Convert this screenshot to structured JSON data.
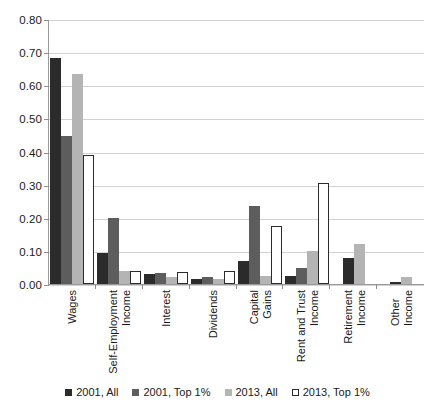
{
  "chart_data": {
    "type": "bar",
    "title": "",
    "subtitle": "",
    "xlabel": "",
    "ylabel": "",
    "ylim": [
      0.0,
      0.8
    ],
    "ytick_labels": [
      "0.80",
      "0.70",
      "0.60",
      "0.50",
      "0.40",
      "0.30",
      "0.20",
      "0.10",
      "0.00"
    ],
    "ytick_values": [
      0.8,
      0.7,
      0.6,
      0.5,
      0.4,
      0.3,
      0.2,
      0.1,
      0.0
    ],
    "grid": true,
    "legend_position": "bottom",
    "categories": [
      "Wages",
      "Self-Employment Income",
      "Interest",
      "Dividends",
      "Capital Gains",
      "Rent and Trust Income",
      "Retirement Income",
      "Other Income"
    ],
    "category_lines": [
      [
        "Wages",
        ""
      ],
      [
        "Self-Employment",
        "Income"
      ],
      [
        "Interest",
        ""
      ],
      [
        "Dividends",
        ""
      ],
      [
        "Capital",
        "Gains"
      ],
      [
        "Rent and Trust",
        "Income"
      ],
      [
        "Retirement",
        "Income"
      ],
      [
        "Other",
        "Income"
      ]
    ],
    "series": [
      {
        "name": "2001, All",
        "color": "#2b2b2b",
        "values": [
          0.685,
          0.095,
          0.03,
          0.015,
          0.07,
          0.025,
          0.08,
          0.005
        ]
      },
      {
        "name": "2001, Top 1%",
        "color": "#5d5d5d",
        "values": [
          0.45,
          0.2,
          0.032,
          0.02,
          0.235,
          0.05,
          0.0,
          0.0
        ]
      },
      {
        "name": "2013, All",
        "color": "#b4b4b4",
        "values": [
          0.635,
          0.04,
          0.022,
          0.015,
          0.025,
          0.1,
          0.12,
          0.02
        ]
      },
      {
        "name": "2013, Top 1%",
        "color": "#ffffff",
        "values": [
          0.39,
          0.04,
          0.035,
          0.04,
          0.175,
          0.305,
          0.0,
          0.0
        ]
      }
    ]
  }
}
